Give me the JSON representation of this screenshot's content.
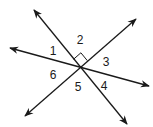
{
  "diagram": {
    "colors": {
      "line": "#1a1a1a",
      "background": "#ffffff"
    },
    "intersection": {
      "x": 80,
      "y": 67
    },
    "lines": [
      {
        "id": "line-a",
        "x1": 34,
        "y1": 10,
        "x2": 127,
        "y2": 124
      },
      {
        "id": "line-b",
        "x1": 10,
        "y1": 48,
        "x2": 149,
        "y2": 86
      },
      {
        "id": "line-c",
        "x1": 25,
        "y1": 116,
        "x2": 136,
        "y2": 19
      }
    ],
    "angle_labels": [
      {
        "text": "1",
        "x": 53,
        "y": 55
      },
      {
        "text": "2",
        "x": 80,
        "y": 44
      },
      {
        "text": "3",
        "x": 106,
        "y": 66
      },
      {
        "text": "4",
        "x": 104,
        "y": 90
      },
      {
        "text": "5",
        "x": 78,
        "y": 91
      },
      {
        "text": "6",
        "x": 53,
        "y": 79
      }
    ],
    "right_angle_marker": {
      "between": [
        "line-a",
        "line-c"
      ],
      "angle": "2"
    }
  }
}
